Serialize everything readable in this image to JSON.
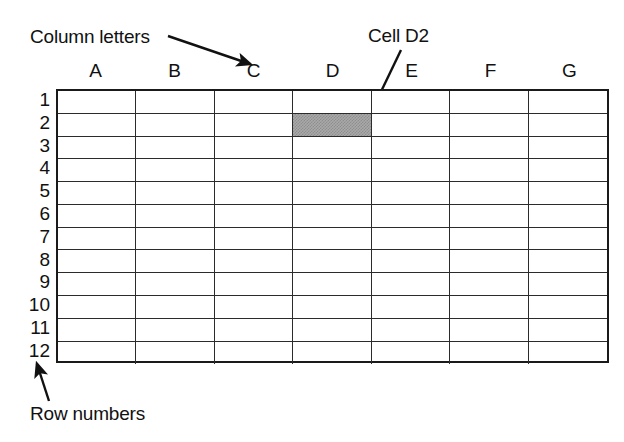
{
  "diagram": {
    "background_color": "#ffffff",
    "line_color": "#2b2b2b",
    "text_color": "#111111",
    "selected_cell_color": "#a9a9a9"
  },
  "annotations": {
    "column_letters": {
      "label": "Column letters",
      "arrow": {
        "from_x": 168,
        "from_y": 36,
        "to_x": 250,
        "to_y": 64,
        "points_to": "column-header-C"
      }
    },
    "cell_d2": {
      "label": "Cell D2",
      "arrow": {
        "from_x": 401,
        "from_y": 50,
        "to_x": 364,
        "to_y": 127,
        "points_to": "cell-D2"
      }
    },
    "row_numbers": {
      "label": "Row numbers",
      "arrow": {
        "from_x": 49,
        "from_y": 401,
        "to_x": 37,
        "to_y": 364,
        "points_to": "row-number-12"
      }
    }
  },
  "spreadsheet": {
    "column_headers": [
      "A",
      "B",
      "C",
      "D",
      "E",
      "F",
      "G"
    ],
    "row_numbers": [
      "1",
      "2",
      "3",
      "4",
      "5",
      "6",
      "7",
      "8",
      "9",
      "10",
      "11",
      "12"
    ],
    "column_count": 7,
    "row_count": 12,
    "selected_cell": {
      "column": "D",
      "row": "2",
      "reference": "D2"
    },
    "cells": [
      [
        "",
        "",
        "",
        "",
        "",
        "",
        ""
      ],
      [
        "",
        "",
        "",
        "",
        "",
        "",
        ""
      ],
      [
        "",
        "",
        "",
        "",
        "",
        "",
        ""
      ],
      [
        "",
        "",
        "",
        "",
        "",
        "",
        ""
      ],
      [
        "",
        "",
        "",
        "",
        "",
        "",
        ""
      ],
      [
        "",
        "",
        "",
        "",
        "",
        "",
        ""
      ],
      [
        "",
        "",
        "",
        "",
        "",
        "",
        ""
      ],
      [
        "",
        "",
        "",
        "",
        "",
        "",
        ""
      ],
      [
        "",
        "",
        "",
        "",
        "",
        "",
        ""
      ],
      [
        "",
        "",
        "",
        "",
        "",
        "",
        ""
      ],
      [
        "",
        "",
        "",
        "",
        "",
        "",
        ""
      ],
      [
        "",
        "",
        "",
        "",
        "",
        "",
        ""
      ]
    ]
  }
}
